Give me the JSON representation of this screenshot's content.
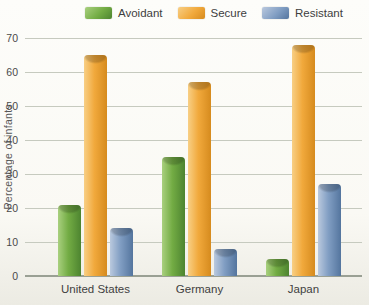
{
  "chart_data": {
    "type": "bar",
    "title": "",
    "ylabel": "Percentage of infants",
    "xlabel": "",
    "categories": [
      "United States",
      "Germany",
      "Japan"
    ],
    "series": [
      {
        "name": "Avoidant",
        "values": [
          21,
          35,
          5
        ],
        "color_light": "#a9d07f",
        "color_mid": "#73ac44",
        "color_dark": "#4d8430"
      },
      {
        "name": "Secure",
        "values": [
          65,
          57,
          68
        ],
        "color_light": "#f8cf85",
        "color_mid": "#f1a93c",
        "color_dark": "#d68b1e"
      },
      {
        "name": "Resistant",
        "values": [
          14,
          8,
          27
        ],
        "color_light": "#bac9de",
        "color_mid": "#819ec3",
        "color_dark": "#54759e"
      }
    ],
    "ylim": [
      0,
      70
    ],
    "ytick_step": 10,
    "yticks": [
      0,
      10,
      20,
      30,
      40,
      50,
      60,
      70
    ],
    "grid": true,
    "legend_position": "top",
    "gridline_color": "#c6cabf",
    "baseline_color": "#9aa094"
  }
}
